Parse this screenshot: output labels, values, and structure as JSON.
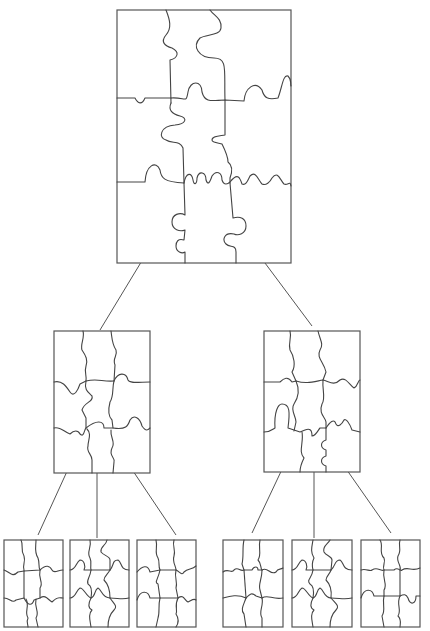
{
  "diagram": {
    "type": "tree",
    "colors": {
      "background": "#ffffff",
      "stroke": "#555555"
    },
    "root": {
      "id": "root",
      "grid": "3x3",
      "box": [
        117,
        10,
        174,
        253
      ]
    },
    "level1": [
      {
        "id": "mid-left",
        "grid": "3x3",
        "box": [
          54,
          331,
          96,
          142
        ]
      },
      {
        "id": "mid-right",
        "grid": "3x3",
        "box": [
          264,
          331,
          96,
          141
        ]
      }
    ],
    "level2": [
      {
        "id": "leaf-1",
        "parent": "mid-left",
        "grid": "3x3",
        "box": [
          4,
          540,
          59,
          87
        ]
      },
      {
        "id": "leaf-2",
        "parent": "mid-left",
        "grid": "3x3",
        "box": [
          70,
          540,
          59,
          87
        ]
      },
      {
        "id": "leaf-3",
        "parent": "mid-left",
        "grid": "3x3",
        "box": [
          137,
          540,
          59,
          87
        ]
      },
      {
        "id": "leaf-4",
        "parent": "mid-right",
        "grid": "3x3",
        "box": [
          223,
          540,
          60,
          87
        ]
      },
      {
        "id": "leaf-5",
        "parent": "mid-right",
        "grid": "3x3",
        "box": [
          292,
          540,
          60,
          87
        ]
      },
      {
        "id": "leaf-6",
        "parent": "mid-right",
        "grid": "3x3",
        "box": [
          361,
          540,
          59,
          87
        ]
      }
    ],
    "edges": [
      {
        "from": "root",
        "to": "mid-left"
      },
      {
        "from": "root",
        "to": "mid-right"
      },
      {
        "from": "mid-left",
        "to": "leaf-1"
      },
      {
        "from": "mid-left",
        "to": "leaf-2"
      },
      {
        "from": "mid-left",
        "to": "leaf-3"
      },
      {
        "from": "mid-right",
        "to": "leaf-4"
      },
      {
        "from": "mid-right",
        "to": "leaf-5"
      },
      {
        "from": "mid-right",
        "to": "leaf-6"
      }
    ]
  }
}
